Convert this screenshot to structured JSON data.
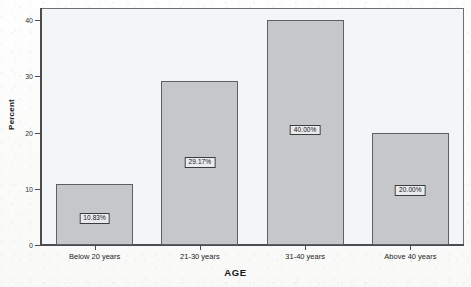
{
  "chart_data": {
    "type": "bar",
    "title": "",
    "xlabel": "AGE",
    "ylabel": "Percent",
    "categories": [
      "Below 20 years",
      "21-30 years",
      "31-40 years",
      "Above 40 years"
    ],
    "values": [
      10.83,
      29.17,
      40.0,
      20.0
    ],
    "bar_labels": [
      "10.83%",
      "29.17%",
      "40.00%",
      "20.00%"
    ],
    "ylim": [
      0,
      42
    ],
    "yticks": [
      0,
      10,
      20,
      30,
      40
    ],
    "ytick_labels": [
      "0",
      "10",
      "20",
      "30",
      "40"
    ],
    "grid": false,
    "legend": null,
    "bar_color": "#c6c7c8",
    "bar_border_color": "#5e6063",
    "plot_background": "#f4f5f7",
    "axis_color": "#4a4c4f",
    "text_color": "#1f2124"
  },
  "bleed_through": {
    "line1": "the scanned page shows faint reverse-side text",
    "line2": "which bleeds through the paper in light grey",
    "line3": "appearing behind the chart plotting region",
    "line4": "as an artifact of the document scan"
  }
}
